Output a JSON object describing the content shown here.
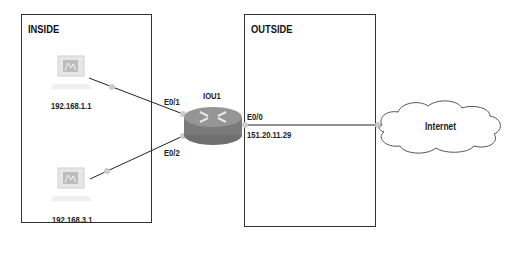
{
  "zones": {
    "inside": {
      "title": "INSIDE"
    },
    "outside": {
      "title": "OUTSIDE"
    }
  },
  "devices": {
    "pc1": {
      "type": "computer-icon",
      "ip": "192.168.1.1"
    },
    "pc2": {
      "type": "computer-icon",
      "ip": "192.168.3.1"
    },
    "router": {
      "type": "router-icon",
      "name": "IOU1"
    },
    "cloud": {
      "type": "cloud-icon",
      "name": "Internet"
    }
  },
  "interfaces": {
    "e01": "E0/1",
    "e02": "E0/2",
    "e00": "E0/0",
    "e00_ip": "151.20.11.29"
  },
  "colors": {
    "border": "#333333",
    "link": "#222222",
    "router_body": "#8a8a8a",
    "endpoint_dot": "#c8c8c8"
  }
}
